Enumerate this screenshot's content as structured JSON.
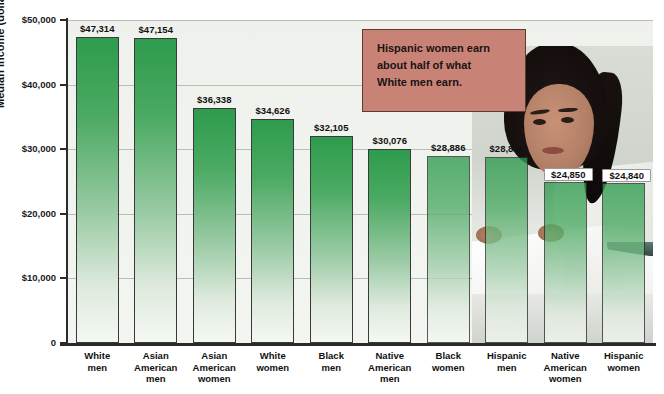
{
  "chart_data": {
    "type": "bar",
    "title": "",
    "xlabel": "",
    "ylabel": "Median income (dollars)",
    "ylim": [
      0,
      50000
    ],
    "grid": true,
    "legend_position": "none",
    "categories": [
      "White men",
      "Asian American men",
      "Asian American women",
      "White women",
      "Black men",
      "Native American men",
      "Black women",
      "Hispanic men",
      "Native American women",
      "Hispanic women"
    ],
    "category_lines": [
      [
        "White",
        "men"
      ],
      [
        "Asian",
        "American",
        "men"
      ],
      [
        "Asian",
        "American",
        "women"
      ],
      [
        "White",
        "women"
      ],
      [
        "Black",
        "men"
      ],
      [
        "Native",
        "American",
        "men"
      ],
      [
        "Black",
        "women"
      ],
      [
        "Hispanic",
        "men"
      ],
      [
        "Native",
        "American",
        "women"
      ],
      [
        "Hispanic",
        "women"
      ]
    ],
    "values": [
      47314,
      47154,
      36338,
      34626,
      32105,
      30076,
      28886,
      28830,
      24850,
      24840
    ],
    "value_labels": [
      "$47,314",
      "$47,154",
      "$36,338",
      "$34,626",
      "$32,105",
      "$30,076",
      "$28,886",
      "$28,830",
      "$24,850",
      "$24,840"
    ],
    "ytick_values": [
      0,
      10000,
      20000,
      30000,
      40000,
      50000
    ],
    "ytick_labels": [
      "0",
      "$10,000",
      "$20,000",
      "$30,000",
      "$40,000",
      "$50,000"
    ],
    "bar_color_top": "#2E9B4E",
    "bar_color_bottom": "#F4F8F3"
  },
  "annotation": {
    "line1": "Hispanic women earn",
    "line2": "about half of what",
    "line3": "White men earn.",
    "box_color": "#C98376",
    "border_color": "#5D3B34"
  },
  "photo": {
    "alt": "Woman with dark ponytail in white lab coat seated at a desk with papers"
  }
}
